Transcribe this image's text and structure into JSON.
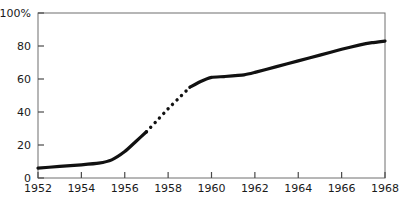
{
  "chart_data": {
    "type": "line",
    "title": "",
    "subtitle": "",
    "xlabel": "",
    "ylabel": "",
    "xlim": [
      1952,
      1968
    ],
    "ylim": [
      0,
      100
    ],
    "grid": false,
    "legend": null,
    "x_tick_labels": [
      "1952",
      "1954",
      "1956",
      "1958",
      "1960",
      "1962",
      "1964",
      "1966",
      "1968"
    ],
    "x_ticks": [
      1952,
      1954,
      1956,
      1958,
      1960,
      1962,
      1964,
      1966,
      1968
    ],
    "y_tick_labels": [
      "0",
      "20",
      "40",
      "60",
      "80",
      "100%"
    ],
    "y_ticks": [
      0,
      20,
      40,
      60,
      80,
      100
    ],
    "y_unit": "%",
    "series": [
      {
        "name": "percentage",
        "style": "solid",
        "color": "#111111",
        "linewidth": 3.2,
        "x": [
          1952,
          1953,
          1954,
          1954.8,
          1955.4,
          1956,
          1956.5,
          1957
        ],
        "values": [
          6,
          7,
          8,
          9,
          11,
          16,
          22,
          28
        ]
      },
      {
        "name": "percentage-interpolated",
        "style": "dotted",
        "color": "#111111",
        "linewidth": 3.2,
        "x": [
          1957,
          1957.5,
          1958,
          1958.5,
          1959
        ],
        "values": [
          28,
          35,
          42,
          48.5,
          55
        ]
      },
      {
        "name": "percentage-continued",
        "style": "solid",
        "color": "#111111",
        "linewidth": 3.2,
        "x": [
          1959,
          1959.5,
          1960,
          1960.6,
          1961.5,
          1962,
          1963,
          1964,
          1965,
          1966,
          1966.8,
          1967.4,
          1968
        ],
        "values": [
          55,
          58.5,
          61,
          61.5,
          62.5,
          64,
          67.5,
          71,
          74.5,
          78,
          80.5,
          82,
          83
        ]
      }
    ]
  },
  "axes": {
    "frame_color": "#6e6e6e",
    "tick_color": "#4a4a4a",
    "label_color": "#1a1a1a"
  }
}
